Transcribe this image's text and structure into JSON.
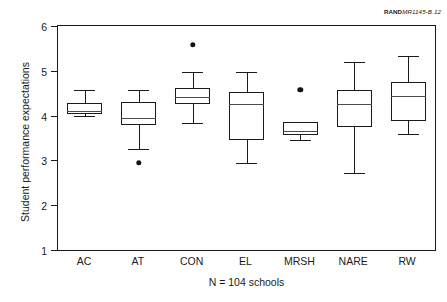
{
  "report_tag": {
    "bold": "RAND",
    "italic": "MR1145-B.12"
  },
  "chart_data": {
    "type": "box",
    "title": "",
    "subtitle": "",
    "xlabel": "N = 104 schools",
    "ylabel": "Student performance expectations",
    "ylim": [
      1,
      6
    ],
    "yticks": [
      1,
      2,
      3,
      4,
      5,
      6
    ],
    "ytick_labels": [
      "1",
      "2",
      "3",
      "4",
      "5",
      "6"
    ],
    "grid": false,
    "legend": "none",
    "categories": [
      "AC",
      "AT",
      "CON",
      "EL",
      "MRSH",
      "NARE",
      "RW"
    ],
    "boxes": [
      {
        "name": "AC",
        "whisker_low": 3.98,
        "q1": 4.03,
        "median": 4.1,
        "q3": 4.28,
        "whisker_high": 4.57,
        "outliers": []
      },
      {
        "name": "AT",
        "whisker_low": 3.26,
        "q1": 3.78,
        "median": 3.94,
        "q3": 4.3,
        "whisker_high": 4.57,
        "outliers": [
          2.94
        ]
      },
      {
        "name": "CON",
        "whisker_low": 3.84,
        "q1": 4.26,
        "median": 4.42,
        "q3": 4.62,
        "whisker_high": 4.97,
        "outliers": [
          5.58
        ]
      },
      {
        "name": "EL",
        "whisker_low": 2.95,
        "q1": 3.46,
        "median": 4.27,
        "q3": 4.53,
        "whisker_high": 4.98,
        "outliers": []
      },
      {
        "name": "MRSH",
        "whisker_low": 3.46,
        "q1": 3.57,
        "median": 3.66,
        "q3": 3.85,
        "whisker_high": 3.85,
        "outliers": [
          4.58
        ]
      },
      {
        "name": "NARE",
        "whisker_low": 2.71,
        "q1": 3.74,
        "median": 4.25,
        "q3": 4.58,
        "whisker_high": 5.2,
        "outliers": []
      },
      {
        "name": "RW",
        "whisker_low": 3.59,
        "q1": 3.88,
        "median": 4.43,
        "q3": 4.75,
        "whisker_high": 5.34,
        "outliers": []
      }
    ],
    "colors": {
      "axis": "#1a1a1a",
      "box_edge": "#1a1a1a",
      "box_fill": "#ffffff",
      "median": "#4a4a4a",
      "outlier": "#141414",
      "background": "#ffffff"
    }
  }
}
